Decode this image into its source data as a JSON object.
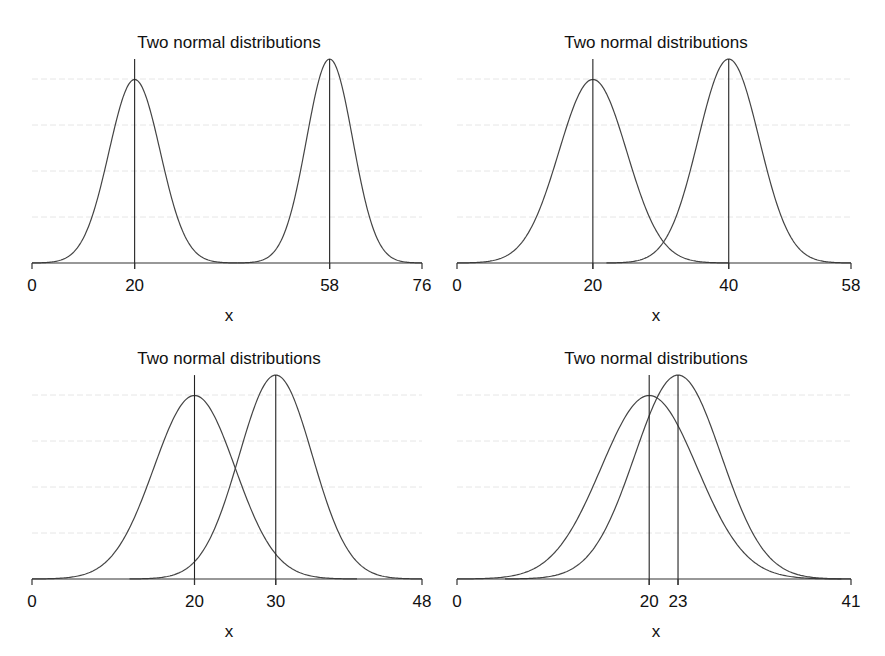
{
  "chart_data": [
    {
      "type": "line",
      "title": "Two normal distributions",
      "xlabel": "x",
      "ylabel": "",
      "xlim": [
        0,
        76
      ],
      "ylim": [
        0,
        0.09
      ],
      "xticks": [
        0,
        20,
        58,
        76
      ],
      "ygrid": [
        0.02,
        0.04,
        0.06,
        0.08
      ],
      "grid": true,
      "series": [
        {
          "name": "Normal(20, 5)",
          "mean": 20,
          "sd": 5
        },
        {
          "name": "Normal(58, 4.5)",
          "mean": 58,
          "sd": 4.5
        }
      ],
      "vlines": [
        20,
        58
      ]
    },
    {
      "type": "line",
      "title": "Two normal distributions",
      "xlabel": "x",
      "ylabel": "",
      "xlim": [
        0,
        58
      ],
      "ylim": [
        0,
        0.09
      ],
      "xticks": [
        0,
        20,
        40,
        58
      ],
      "ygrid": [
        0.02,
        0.04,
        0.06,
        0.08
      ],
      "grid": true,
      "series": [
        {
          "name": "Normal(20, 5)",
          "mean": 20,
          "sd": 5
        },
        {
          "name": "Normal(40, 4.5)",
          "mean": 40,
          "sd": 4.5
        }
      ],
      "vlines": [
        20,
        40
      ]
    },
    {
      "type": "line",
      "title": "Two normal distributions",
      "xlabel": "x",
      "ylabel": "",
      "xlim": [
        0,
        48
      ],
      "ylim": [
        0,
        0.09
      ],
      "xticks": [
        0,
        20,
        30,
        48
      ],
      "ygrid": [
        0.02,
        0.04,
        0.06,
        0.08
      ],
      "grid": true,
      "series": [
        {
          "name": "Normal(20, 5)",
          "mean": 20,
          "sd": 5
        },
        {
          "name": "Normal(30, 4.5)",
          "mean": 30,
          "sd": 4.5
        }
      ],
      "vlines": [
        20,
        30
      ]
    },
    {
      "type": "line",
      "title": "Two normal distributions",
      "xlabel": "x",
      "ylabel": "",
      "xlim": [
        0,
        41
      ],
      "ylim": [
        0,
        0.09
      ],
      "xticks": [
        0,
        20,
        23,
        41
      ],
      "ygrid": [
        0.02,
        0.04,
        0.06,
        0.08
      ],
      "grid": true,
      "series": [
        {
          "name": "Normal(20, 5)",
          "mean": 20,
          "sd": 5
        },
        {
          "name": "Normal(23, 4.5)",
          "mean": 23,
          "sd": 4.5
        }
      ],
      "vlines": [
        20,
        23
      ]
    }
  ],
  "panels": [
    {
      "title": "Two normal distributions",
      "xlabel": "x",
      "ticks": [
        "0",
        "20",
        "58",
        "76"
      ]
    },
    {
      "title": "Two normal distributions",
      "xlabel": "x",
      "ticks": [
        "0",
        "20",
        "40",
        "58"
      ]
    },
    {
      "title": "Two normal distributions",
      "xlabel": "x",
      "ticks": [
        "0",
        "20",
        "30",
        "48"
      ]
    },
    {
      "title": "Two normal distributions",
      "xlabel": "x",
      "ticks": [
        "0",
        "20",
        "23",
        "41"
      ]
    }
  ],
  "colors": {
    "curve": "#444444",
    "axis": "#333333",
    "grid": "#e6e6e6",
    "text": "#111111"
  }
}
